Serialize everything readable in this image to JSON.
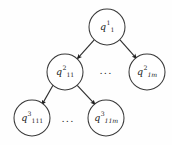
{
  "figure": {
    "type": "tree-diagram",
    "background_color": "#fefefe",
    "node_stroke_color": "#3a3a3a",
    "edge_color": "#2e2e2e",
    "text_color": "#1c1c1c"
  },
  "nodes": [
    {
      "id": "root",
      "base": "q",
      "subscript": "1",
      "superscript": "1",
      "level": 1,
      "cx": 107,
      "cy": 27,
      "r": 18
    },
    {
      "id": "level2-first",
      "base": "q",
      "subscript": "11",
      "superscript": "2",
      "level": 2,
      "cx": 65,
      "cy": 72,
      "r": 18
    },
    {
      "id": "level2-last",
      "base": "q",
      "subscript": "1m",
      "superscript": "2",
      "level": 2,
      "cx": 147,
      "cy": 72,
      "r": 18
    },
    {
      "id": "level3-first",
      "base": "q",
      "subscript": "111",
      "superscript": "3",
      "level": 3,
      "cx": 32,
      "cy": 118,
      "r": 18
    },
    {
      "id": "level3-last",
      "base": "q",
      "subscript": "11m",
      "superscript": "3",
      "level": 3,
      "cx": 106,
      "cy": 118,
      "r": 18
    }
  ],
  "edges": [
    {
      "id": "root-to-level2-first",
      "from": "root",
      "to": "level2-first",
      "arrow": true
    },
    {
      "id": "root-to-level2-last",
      "from": "root",
      "to": "level2-last",
      "arrow": true
    },
    {
      "id": "level2-first-to-level3-first",
      "from": "level2-first",
      "to": "level3-first",
      "arrow": true
    },
    {
      "id": "level2-first-to-level3-last",
      "from": "level2-first",
      "to": "level3-last",
      "arrow": true
    }
  ],
  "ellipses": [
    {
      "id": "level2-ellipsis",
      "text": "...",
      "x": 106,
      "y": 71
    },
    {
      "id": "level3-ellipsis",
      "text": "...",
      "x": 68,
      "y": 119
    }
  ]
}
